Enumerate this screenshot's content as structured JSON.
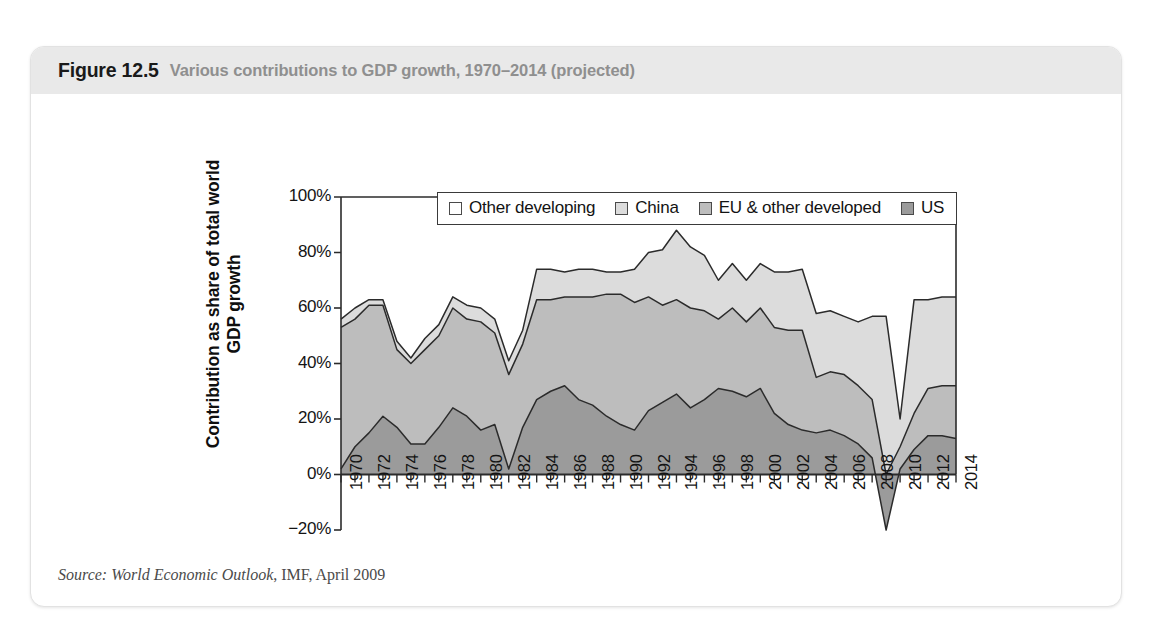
{
  "figure": {
    "number": "Figure 12.5",
    "caption": "Various contributions to GDP growth, 1970–2014 (projected)",
    "source_label": "Source:",
    "source_publication": "World Economic Outlook",
    "source_rest": ", IMF, April 2009"
  },
  "colors": {
    "us": "#9b9b9b",
    "eu_other_developed": "#bdbdbd",
    "china": "#dcdcdc",
    "other_developing": "#ffffff",
    "line": "#2b2b2b",
    "caption_band": "#e9e9e9",
    "caption_number": "#1a1a1a",
    "caption_text": "#8f8f8f",
    "axis": "#2b2b2b"
  },
  "chart_data": {
    "type": "area",
    "stacked": true,
    "title": "Various contributions to GDP growth, 1970–2014 (projected)",
    "xlabel": "",
    "ylabel": "Contribution as share of total world GDP growth",
    "ylim": [
      -20,
      100
    ],
    "yticks": [
      -20,
      0,
      20,
      40,
      60,
      80,
      100
    ],
    "ytick_labels": [
      "−20%",
      "0%",
      "20%",
      "40%",
      "60%",
      "80%",
      "100%"
    ],
    "grid": false,
    "legend_position": "top-center-inside",
    "xlim": [
      1970,
      2014
    ],
    "x": [
      1970,
      1971,
      1972,
      1973,
      1974,
      1975,
      1976,
      1977,
      1978,
      1979,
      1980,
      1981,
      1982,
      1983,
      1984,
      1985,
      1986,
      1987,
      1988,
      1989,
      1990,
      1991,
      1992,
      1993,
      1994,
      1995,
      1996,
      1997,
      1998,
      1999,
      2000,
      2001,
      2002,
      2003,
      2004,
      2005,
      2006,
      2007,
      2008,
      2009,
      2010,
      2011,
      2012,
      2013,
      2014
    ],
    "xtick_labels": [
      "1970",
      "1972",
      "1974",
      "1976",
      "1978",
      "1980",
      "1982",
      "1984",
      "1986",
      "1988",
      "1990",
      "1992",
      "1994",
      "1996",
      "1998",
      "2000",
      "2002",
      "2004",
      "2006",
      "2008",
      "2010",
      "2012",
      "2014"
    ],
    "xtick_step": 2,
    "series": [
      {
        "name": "US",
        "color": "#9b9b9b",
        "values": [
          2,
          10,
          15,
          21,
          17,
          11,
          11,
          17,
          24,
          21,
          16,
          18,
          2,
          17,
          27,
          30,
          32,
          27,
          25,
          21,
          18,
          16,
          23,
          26,
          29,
          24,
          27,
          31,
          30,
          28,
          31,
          22,
          18,
          16,
          15,
          16,
          14,
          11,
          6,
          -20,
          2,
          9,
          14,
          14,
          13
        ]
      },
      {
        "name": "EU & other developed",
        "color": "#bdbdbd",
        "values": [
          51,
          46,
          46,
          40,
          28,
          29,
          34,
          33,
          36,
          35,
          39,
          33,
          34,
          30,
          36,
          33,
          32,
          37,
          39,
          44,
          47,
          46,
          41,
          35,
          34,
          36,
          32,
          25,
          30,
          27,
          29,
          31,
          34,
          36,
          20,
          21,
          22,
          21,
          21,
          20,
          8,
          13,
          17,
          18,
          19
        ]
      },
      {
        "name": "China",
        "color": "#dcdcdc",
        "values": [
          3,
          4,
          2,
          2,
          3,
          2,
          4,
          4,
          4,
          5,
          5,
          5,
          5,
          5,
          11,
          11,
          9,
          10,
          10,
          8,
          8,
          12,
          16,
          20,
          25,
          22,
          20,
          14,
          16,
          15,
          16,
          20,
          21,
          22,
          23,
          22,
          21,
          23,
          30,
          57,
          10,
          41,
          32,
          32,
          32
        ]
      },
      {
        "name": "Other developing",
        "color": "#ffffff",
        "values": [
          44,
          40,
          37,
          37,
          52,
          58,
          51,
          46,
          36,
          39,
          40,
          44,
          59,
          48,
          26,
          26,
          27,
          26,
          26,
          27,
          27,
          26,
          20,
          19,
          12,
          18,
          21,
          30,
          24,
          30,
          24,
          27,
          27,
          26,
          42,
          41,
          43,
          45,
          43,
          43,
          80,
          37,
          37,
          36,
          36
        ]
      }
    ]
  },
  "legend": {
    "items": [
      {
        "label": "Other developing",
        "swatch": "#ffffff"
      },
      {
        "label": "China",
        "swatch": "#dcdcdc"
      },
      {
        "label": "EU & other developed",
        "swatch": "#bdbdbd"
      },
      {
        "label": "US",
        "swatch": "#9b9b9b"
      }
    ]
  }
}
